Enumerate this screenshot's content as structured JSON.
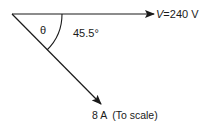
{
  "diagram": {
    "type": "phasor",
    "colors": {
      "ink": "#1a1a1a",
      "background": "#ffffff"
    },
    "origin": [
      12,
      14
    ],
    "voltage_phasor": {
      "symbol": "V",
      "equals": "=",
      "value": "240 V",
      "end": [
        154,
        14
      ]
    },
    "current_phasor": {
      "label": "8 A",
      "note": "(To scale)",
      "end": [
        101,
        104
      ]
    },
    "angle": {
      "symbol": "θ",
      "value_label": "45.5°"
    }
  }
}
